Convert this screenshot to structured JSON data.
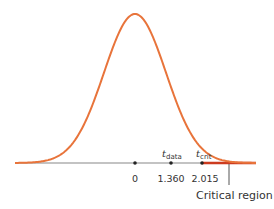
{
  "chart_data": {
    "type": "line",
    "title": "",
    "xlabel": "",
    "ylabel": "",
    "grid": false,
    "legend": null,
    "series": [
      {
        "name": "t density",
        "color": "#e8743b",
        "kind": "bell-curve",
        "center": 0
      }
    ],
    "critical_region": {
      "from": 2.015,
      "side": "right",
      "color": "#cc3b1f",
      "label": "Critical region"
    },
    "ticks": [
      {
        "value": 0,
        "label": "0"
      },
      {
        "value": 1.36,
        "label": "1.360",
        "marker": "t",
        "marker_sub": "data"
      },
      {
        "value": 2.015,
        "label": "2.015",
        "marker": "t",
        "marker_sub": "crit"
      }
    ]
  },
  "labels": {
    "tick_0": "0",
    "tick_data": "1.360",
    "tick_crit": "2.015",
    "t_data_main": "t",
    "t_data_sub": "data",
    "t_crit_main": "t",
    "t_crit_sub": "crit",
    "critical_region": "Critical region"
  }
}
